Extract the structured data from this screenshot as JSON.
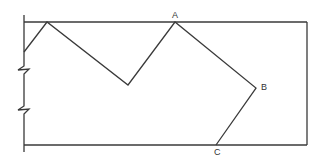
{
  "diagram": {
    "colors": {
      "line": "#3a3a3a",
      "label": "#333333",
      "background": "#ffffff"
    },
    "boundary": {
      "left_x": 24,
      "right_x": 307,
      "top_y": 22,
      "bottom_y": 145,
      "left_wall_top": 15,
      "left_wall_bottom": 152
    },
    "break_marks": [
      {
        "y": 70
      },
      {
        "y": 110
      }
    ],
    "path_points": [
      {
        "x": 24,
        "y": 52
      },
      {
        "x": 47,
        "y": 22
      },
      {
        "x": 128,
        "y": 85
      },
      {
        "x": 175,
        "y": 22,
        "label": "A"
      },
      {
        "x": 256,
        "y": 88,
        "label": "B"
      },
      {
        "x": 216,
        "y": 145,
        "label": "C"
      }
    ],
    "labels": [
      {
        "text": "A",
        "x": 172,
        "y": 18
      },
      {
        "text": "B",
        "x": 261,
        "y": 90
      },
      {
        "text": "C",
        "x": 214,
        "y": 155
      }
    ]
  }
}
